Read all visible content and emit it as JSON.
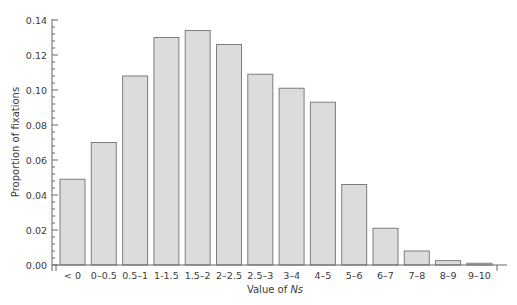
{
  "chart_data": {
    "type": "bar",
    "title": "",
    "xlabel": "Value of Ns",
    "xlabel_parts": {
      "prefix": "Value of ",
      "italic": "Ns"
    },
    "ylabel": "Proportion of fixations",
    "ylim": [
      0,
      0.14
    ],
    "yticks": [
      "0.00",
      "0.02",
      "0.04",
      "0.06",
      "0.08",
      "0.10",
      "0.12",
      "0.14"
    ],
    "grid": false,
    "legend": null,
    "categories": [
      "< 0",
      "0–0.5",
      "0.5–1",
      "1-1.5",
      "1.5–2",
      "2–2.5",
      "2.5–3",
      "3–4",
      "4–5",
      "5–6",
      "6–7",
      "7–8",
      "8–9",
      "9–10"
    ],
    "values": [
      0.049,
      0.07,
      0.108,
      0.13,
      0.134,
      0.126,
      0.109,
      0.101,
      0.093,
      0.046,
      0.021,
      0.008,
      0.0025,
      0.001
    ],
    "colors": {
      "bar_fill": "#dcdcdc",
      "bar_stroke": "#7d7d7d",
      "axis": "#666666",
      "text": "#3a3a3a"
    }
  }
}
